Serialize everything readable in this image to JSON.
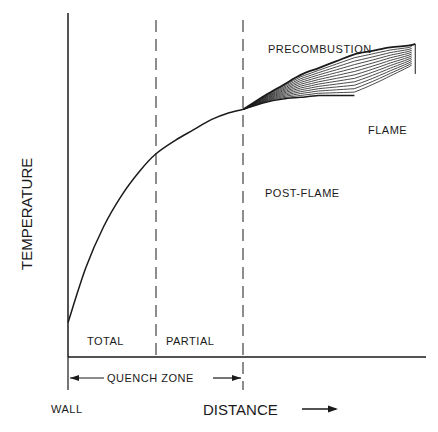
{
  "chart_data": {
    "type": "line",
    "title": "",
    "xlabel": "DISTANCE",
    "ylabel": "TEMPERATURE",
    "x_origin_label": "WALL",
    "xlim": [
      0,
      1
    ],
    "ylim": [
      0,
      1
    ],
    "grid": false,
    "zones": [
      {
        "name": "TOTAL",
        "from": 0.0,
        "to": 0.245
      },
      {
        "name": "PARTIAL",
        "from": 0.245,
        "to": 0.49
      }
    ],
    "quench_zone": {
      "label": "QUENCH ZONE",
      "from": 0.0,
      "to": 0.49
    },
    "regions": [
      "PRECOMBUSTION",
      "FLAME",
      "POST-FLAME"
    ],
    "series": [
      {
        "name": "temperature-profile",
        "x": [
          0.0,
          0.05,
          0.1,
          0.15,
          0.2,
          0.245,
          0.3,
          0.35,
          0.4,
          0.45,
          0.49
        ],
        "y": [
          0.1,
          0.26,
          0.38,
          0.47,
          0.54,
          0.59,
          0.63,
          0.66,
          0.69,
          0.71,
          0.72
        ]
      },
      {
        "name": "flame-upper",
        "x": [
          0.49,
          0.55,
          0.6,
          0.65,
          0.7,
          0.75,
          0.8,
          0.85,
          0.9,
          0.95,
          0.97
        ],
        "y": [
          0.72,
          0.76,
          0.79,
          0.82,
          0.84,
          0.86,
          0.88,
          0.89,
          0.9,
          0.905,
          0.91
        ]
      },
      {
        "name": "flame-lower",
        "x": [
          0.49,
          0.55,
          0.6,
          0.65,
          0.7,
          0.75,
          0.8
        ],
        "y": [
          0.72,
          0.74,
          0.75,
          0.755,
          0.76,
          0.76,
          0.76
        ]
      }
    ]
  }
}
